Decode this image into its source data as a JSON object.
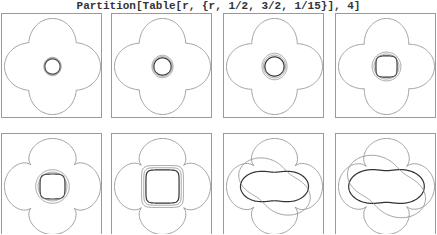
{
  "title": "Partition[Table[r, {r, 1/2, 3/2, 1/15}], 4]",
  "colors": {
    "frame": "#9a9a9a",
    "outer_curve": "#8a8a8a",
    "inner_curves": "#333333"
  },
  "grid": {
    "rows": 2,
    "cols": 4,
    "panel_positions": [
      {
        "x": 1,
        "y": 13
      },
      {
        "x": 111,
        "y": 13
      },
      {
        "x": 223,
        "y": 13
      },
      {
        "x": 335,
        "y": 13
      },
      {
        "x": 1,
        "y": 133
      },
      {
        "x": 111,
        "y": 133
      },
      {
        "x": 223,
        "y": 133
      },
      {
        "x": 335,
        "y": 133
      }
    ]
  },
  "panels": [
    {
      "r": 0.5,
      "ring_radii": [
        0.16,
        0.17,
        0.18
      ],
      "ring_style": "circle"
    },
    {
      "r": 0.5667,
      "ring_radii": [
        0.18,
        0.2,
        0.22
      ],
      "ring_style": "circle"
    },
    {
      "r": 0.6333,
      "ring_radii": [
        0.2,
        0.23,
        0.26
      ],
      "ring_style": "circle"
    },
    {
      "r": 0.7,
      "ring_radii": [
        0.22,
        0.26,
        0.3
      ],
      "ring_style": "mixed"
    },
    {
      "r": 0.7667,
      "ring_radii": [
        0.26,
        0.3,
        0.35
      ],
      "ring_style": "mixed"
    },
    {
      "r": 0.8333,
      "ring_radii": [
        0.3,
        0.34,
        0.38
      ],
      "ring_style": "lens"
    },
    {
      "r": 0.9,
      "ring_radii": [
        0.45,
        0.55
      ],
      "ring_style": "petals"
    },
    {
      "r": 0.9667,
      "ring_radii": [
        0.5,
        0.6
      ],
      "ring_style": "petals"
    }
  ]
}
